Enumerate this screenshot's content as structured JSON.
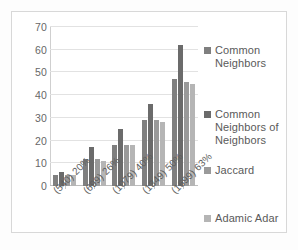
{
  "chart_data": {
    "type": "bar",
    "title": "",
    "subtitle": "",
    "xlabel": "",
    "ylabel": "",
    "ylim": [
      0,
      70
    ],
    "ytick_step": 10,
    "yticks": [
      70,
      60,
      50,
      40,
      30,
      20,
      10,
      0
    ],
    "grid": true,
    "legend_position": "right",
    "categories": [
      "(540) 20%",
      "(699) 26%",
      "(1079) 40%",
      "(1349) 50%",
      "(1699) 63%"
    ],
    "series": [
      {
        "name": "Common Neighbors",
        "color": "#7f7f7f",
        "values": [
          5,
          12,
          18,
          29,
          47
        ]
      },
      {
        "name": "Common Neighbors of Neighbors",
        "color": "#6b6b6b",
        "values": [
          6,
          17,
          25,
          36,
          62
        ]
      },
      {
        "name": "Jaccard",
        "color": "#9a9a9a",
        "values": [
          5,
          12,
          18,
          29,
          46
        ]
      },
      {
        "name": "Adamic Adar",
        "color": "#b5b5b5",
        "values": [
          5,
          11,
          18,
          28,
          45
        ]
      }
    ]
  }
}
